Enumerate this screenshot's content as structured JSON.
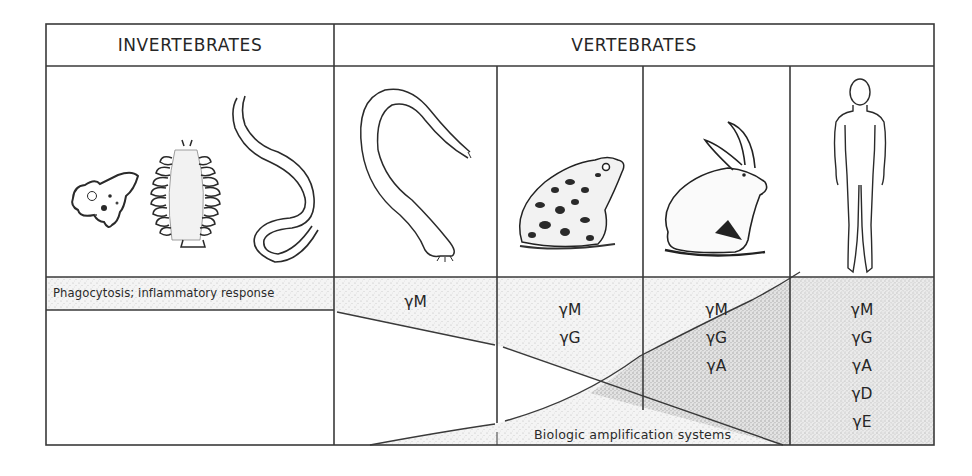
{
  "figure": {
    "type": "comparative phylogeny table of immune responses",
    "headers": {
      "invertebrates": "INVERTEBRATES",
      "vertebrates": "VERTEBRATES"
    },
    "organisms": [
      {
        "group": "invertebrates",
        "name": "amoeba",
        "column": 0
      },
      {
        "group": "invertebrates",
        "name": "annelid-polychaete",
        "column": 0
      },
      {
        "group": "invertebrates",
        "name": "earthworm",
        "column": 0
      },
      {
        "group": "vertebrates",
        "name": "lamprey-hagfish",
        "column": 1
      },
      {
        "group": "vertebrates",
        "name": "frog-toad",
        "column": 2
      },
      {
        "group": "vertebrates",
        "name": "rabbit",
        "column": 3
      },
      {
        "group": "vertebrates",
        "name": "human",
        "column": 4
      }
    ],
    "invertebrate_response": "Phagocytosis; inflammatory response",
    "immunoglobulins": [
      {
        "column": 1,
        "classes": [
          "γM"
        ]
      },
      {
        "column": 2,
        "classes": [
          "γM",
          "γG"
        ]
      },
      {
        "column": 3,
        "classes": [
          "γM",
          "γG",
          "γA"
        ]
      },
      {
        "column": 4,
        "classes": [
          "γM",
          "γG",
          "γA",
          "γD",
          "γE"
        ]
      }
    ],
    "display_labels": {
      "col1": [
        "γM"
      ],
      "col2": [
        "γM",
        "γG"
      ],
      "col3": [
        "γM",
        "γG",
        "γA"
      ],
      "col4": [
        "γM",
        "γG",
        "γA",
        "γD",
        "γE"
      ]
    },
    "amplification_label": "Biologic amplification systems",
    "colors": {
      "line": "#3a3a3a",
      "stipple_light": "#e4e4e4",
      "stipple_dark": "#c9c9c9",
      "background": "#ffffff"
    }
  }
}
